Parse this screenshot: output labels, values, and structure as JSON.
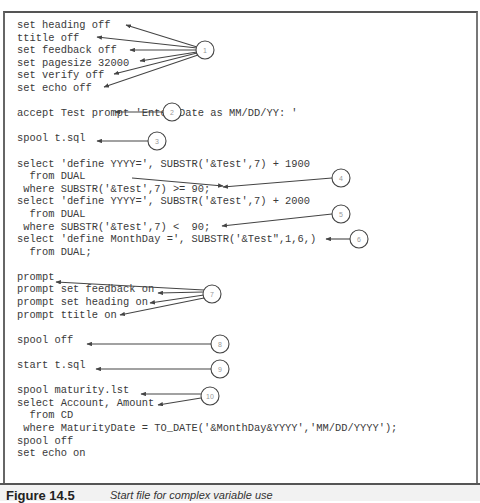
{
  "code_lines": [
    "set heading off",
    "ttitle off",
    "set feedback off",
    "set pagesize 32000",
    "set verify off",
    "set echo off",
    "",
    "accept Test prompt 'Enter Date as MM/DD/YY: '",
    "",
    "spool t.sql",
    "",
    "select 'define YYYY=', SUBSTR('&Test',7) + 1900",
    "  from DUAL",
    " where SUBSTR('&Test',7) >= 90;",
    "select 'define YYYY=', SUBSTR('&Test',7) + 2000",
    "  from DUAL",
    " where SUBSTR('&Test',7) <  90;",
    "select 'define MonthDay =', SUBSTR('&Test\",1,6,)",
    "  from DUAL;",
    "",
    "prompt",
    "prompt set feedback on",
    "prompt set heading on",
    "prompt ttitle on",
    "",
    "spool off",
    "",
    "start t.sql",
    "",
    "spool maturity.lst",
    "select Account, Amount",
    "  from CD",
    " where MaturityDate = TO_DATE('&MonthDay&YYYY','MM/DD/YYYY');",
    "spool off",
    "set echo on"
  ],
  "callouts": [
    {
      "num": "1"
    },
    {
      "num": "2"
    },
    {
      "num": "3"
    },
    {
      "num": "4"
    },
    {
      "num": "5"
    },
    {
      "num": "6"
    },
    {
      "num": "7"
    },
    {
      "num": "8"
    },
    {
      "num": "9"
    },
    {
      "num": "10"
    }
  ],
  "caption": {
    "label": "Figure 14.5",
    "text": "Start file for complex variable use"
  }
}
